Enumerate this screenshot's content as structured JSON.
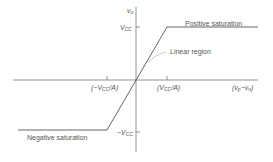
{
  "diagram": {
    "axes": {
      "y_label": "v_o",
      "x_label": "(v_p − v_n)",
      "y_ticks": [
        {
          "label_main": "V",
          "label_sub": "CC",
          "prefix": "",
          "value": "+Vcc"
        },
        {
          "label_main": "V",
          "label_sub": "CC",
          "prefix": "−",
          "value": "-Vcc"
        }
      ],
      "x_ticks": [
        {
          "label": "(−V_CC/A)",
          "prefix": "(−V",
          "sub": "CC",
          "suffix": "/A)"
        },
        {
          "label": "(V_CC/A)",
          "prefix": "(V",
          "sub": "CC",
          "suffix": "/A)"
        }
      ]
    },
    "regions": {
      "positive": "Positive saturation",
      "linear": "Linear region",
      "negative": "Negative saturation"
    },
    "colors": {
      "curve": "#555555",
      "axis": "#777777",
      "leader": "#bbbbbb",
      "text": "#555555"
    }
  }
}
